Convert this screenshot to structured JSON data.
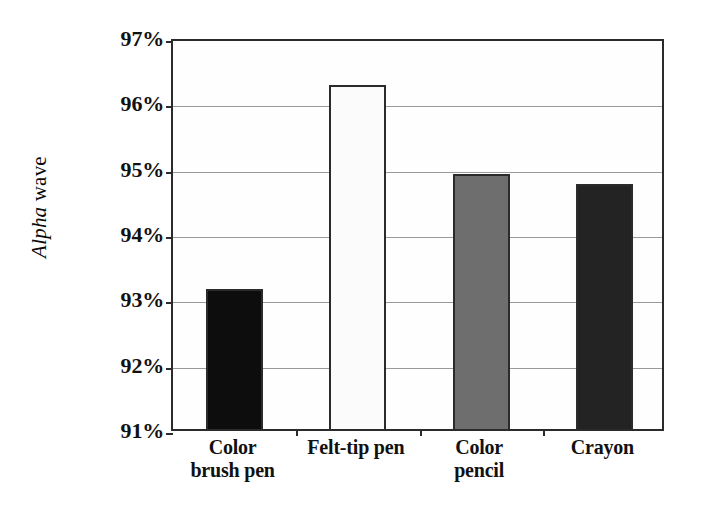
{
  "chart_data": {
    "type": "bar",
    "title": "",
    "xlabel": "",
    "ylabel": "Alpha wave",
    "ylabel_parts": {
      "italic": "Alpha",
      "roman": " wave"
    },
    "categories": [
      "Color brush pen",
      "Felt-tip pen",
      "Color pencil",
      "Crayon"
    ],
    "category_lines": [
      [
        "Color",
        "brush pen"
      ],
      [
        "Felt-tip pen"
      ],
      [
        "Color",
        "pencil"
      ],
      [
        "Crayon"
      ]
    ],
    "values": [
      93.15,
      96.27,
      94.9,
      94.75
    ],
    "value_labels": [
      "93.15%",
      "96.27%",
      "94.90%",
      "94.75%"
    ],
    "ylim": [
      91,
      97
    ],
    "ytick_values": [
      97,
      96,
      95,
      94,
      93,
      92,
      91
    ],
    "ytick_labels": [
      "97%",
      "96%",
      "95%",
      "94%",
      "93%",
      "92%",
      "91%"
    ],
    "grid": true,
    "grid_axis": "y",
    "legend": false,
    "legend_position": "none",
    "bar_colors": [
      "#0d0d0d",
      "#fbfbfb",
      "#6e6e6e",
      "#232323"
    ],
    "bar_border_color": "#2b2b2b",
    "frame_color": "#2b2b2b",
    "gridline_color": "#9a9a9a",
    "background": "#ffffff"
  }
}
